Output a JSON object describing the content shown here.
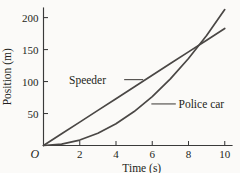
{
  "chart_data": {
    "type": "line",
    "title": "",
    "xlabel": "Time (s)",
    "ylabel": "Position (m)",
    "xlim": [
      0,
      10.4
    ],
    "ylim": [
      0,
      215
    ],
    "grid": false,
    "legend_position": "inline-annotations",
    "origin_label": "O",
    "xticks": [
      2,
      4,
      6,
      8,
      10
    ],
    "xtick_labels": [
      "2",
      "4",
      "6",
      "8",
      "10"
    ],
    "yticks": [
      50,
      100,
      150,
      200
    ],
    "ytick_labels": [
      "50",
      "100",
      "150",
      "200"
    ],
    "line_color": "#4a4745",
    "axis_color": "#3a3a3a",
    "background_color": "#fbfaf8",
    "series": [
      {
        "name": "Speeder",
        "shape": "straight line, constant velocity",
        "x": [
          0,
          1,
          2,
          3,
          4,
          5,
          6,
          7,
          8,
          9,
          10
        ],
        "values": [
          0,
          18.3,
          36.6,
          54.9,
          73.2,
          91.5,
          109.8,
          128.1,
          146.4,
          164.7,
          183
        ]
      },
      {
        "name": "Police car",
        "shape": "parabola, constant acceleration from rest",
        "x": [
          0,
          1,
          2,
          3,
          4,
          5,
          6,
          7,
          8,
          9,
          10
        ],
        "values": [
          0,
          2.12,
          8.5,
          19.1,
          34,
          53.1,
          76.5,
          104.1,
          136,
          172.1,
          212.5
        ]
      }
    ],
    "annotations": [
      {
        "label": "Speeder",
        "text_x": 3.45,
        "text_y": 103,
        "leader_from_x": 4.45,
        "leader_from_y": 103,
        "leader_to_x": 5.5,
        "leader_to_y": 103
      },
      {
        "label": "Police car",
        "text_x": 7.45,
        "text_y": 65,
        "leader_from_x": 7.3,
        "leader_from_y": 65,
        "leader_to_x": 5.95,
        "leader_to_y": 65
      }
    ],
    "intersection": {
      "x": 8.2,
      "y": 150
    }
  }
}
